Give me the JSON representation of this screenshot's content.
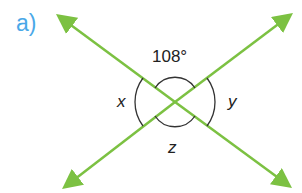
{
  "part_label": "a)",
  "angles": {
    "top": "108°",
    "left": "x",
    "right": "y",
    "bottom": "z"
  },
  "colors": {
    "line": "#7cc142",
    "arc": "#333333",
    "part_label": "#4aa8e8",
    "text": "#222222"
  }
}
